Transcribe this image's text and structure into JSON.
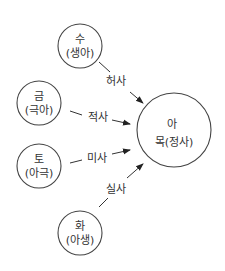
{
  "center": {
    "line1": "아",
    "line2": "목(정사)"
  },
  "nodes": [
    {
      "id": "su",
      "line1": "수",
      "line2": "(생아)"
    },
    {
      "id": "geum",
      "line1": "금",
      "line2": "(극아)"
    },
    {
      "id": "to",
      "line1": "토",
      "line2": "(아극)"
    },
    {
      "id": "hwa",
      "line1": "화",
      "line2": "(아생)"
    }
  ],
  "edges": [
    {
      "from": "su",
      "label": "허사"
    },
    {
      "from": "geum",
      "label": "적사"
    },
    {
      "from": "to",
      "label": "미사"
    },
    {
      "from": "hwa",
      "label": "실사"
    }
  ],
  "colors": {
    "stroke": "#444444",
    "text": "#333333"
  }
}
